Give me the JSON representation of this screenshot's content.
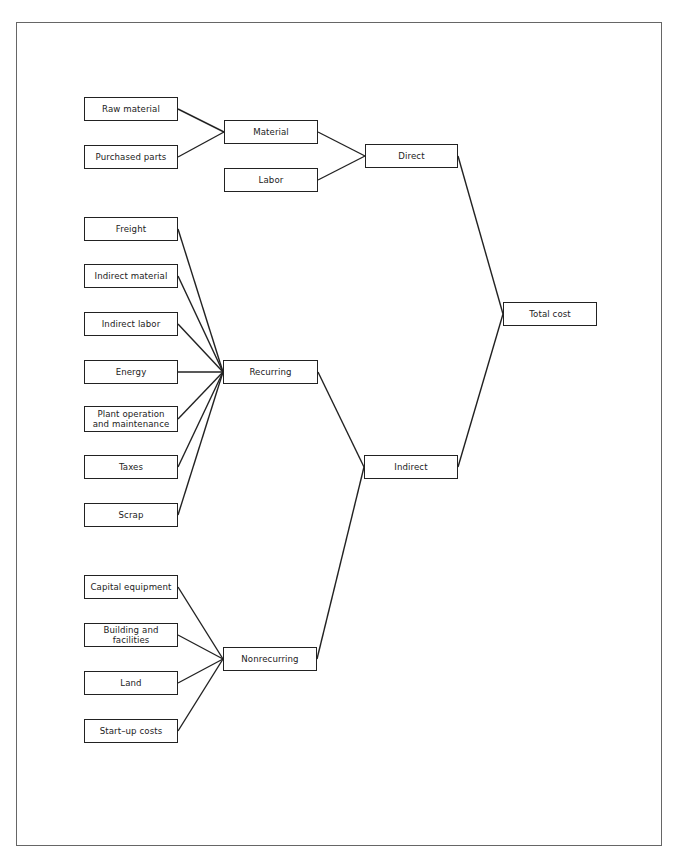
{
  "diagram": {
    "type": "tree",
    "direction": "right-to-left",
    "root": "Total cost",
    "nodes": [
      {
        "id": "total",
        "label": "Total cost",
        "x": 503,
        "y": 302,
        "w": 94,
        "h": 24
      },
      {
        "id": "direct",
        "label": "Direct",
        "x": 365,
        "y": 144,
        "w": 93,
        "h": 24
      },
      {
        "id": "indirect",
        "label": "Indirect",
        "x": 364,
        "y": 455,
        "w": 94,
        "h": 24
      },
      {
        "id": "material",
        "label": "Material",
        "x": 224,
        "y": 120,
        "w": 94,
        "h": 24
      },
      {
        "id": "labor",
        "label": "Labor",
        "x": 224,
        "y": 168,
        "w": 94,
        "h": 24
      },
      {
        "id": "recurring",
        "label": "Recurring",
        "x": 223,
        "y": 360,
        "w": 95,
        "h": 24
      },
      {
        "id": "nonrecurring",
        "label": "Nonrecurring",
        "x": 223,
        "y": 647,
        "w": 94,
        "h": 24
      },
      {
        "id": "raw",
        "label": "Raw material",
        "x": 84,
        "y": 97,
        "w": 94,
        "h": 24
      },
      {
        "id": "purchased",
        "label": "Purchased parts",
        "x": 84,
        "y": 145,
        "w": 94,
        "h": 24
      },
      {
        "id": "freight",
        "label": "Freight",
        "x": 84,
        "y": 217,
        "w": 94,
        "h": 24
      },
      {
        "id": "indmat",
        "label": "Indirect material",
        "x": 84,
        "y": 264,
        "w": 94,
        "h": 24
      },
      {
        "id": "indlab",
        "label": "Indirect labor",
        "x": 84,
        "y": 312,
        "w": 94,
        "h": 24
      },
      {
        "id": "energy",
        "label": "Energy",
        "x": 84,
        "y": 360,
        "w": 94,
        "h": 24
      },
      {
        "id": "plant",
        "label": "Plant operation and maintenance",
        "x": 84,
        "y": 406,
        "w": 94,
        "h": 26
      },
      {
        "id": "taxes",
        "label": "Taxes",
        "x": 84,
        "y": 455,
        "w": 94,
        "h": 24
      },
      {
        "id": "scrap",
        "label": "Scrap",
        "x": 84,
        "y": 503,
        "w": 94,
        "h": 24
      },
      {
        "id": "capital",
        "label": "Capital equipment",
        "x": 84,
        "y": 575,
        "w": 94,
        "h": 24
      },
      {
        "id": "building",
        "label": "Building and facilities",
        "x": 84,
        "y": 623,
        "w": 94,
        "h": 24
      },
      {
        "id": "land",
        "label": "Land",
        "x": 84,
        "y": 671,
        "w": 94,
        "h": 24
      },
      {
        "id": "startup",
        "label": "Start–up costs",
        "x": 84,
        "y": 719,
        "w": 94,
        "h": 24
      }
    ],
    "edges": [
      [
        "direct",
        "total"
      ],
      [
        "indirect",
        "total"
      ],
      [
        "material",
        "direct"
      ],
      [
        "labor",
        "direct"
      ],
      [
        "recurring",
        "indirect"
      ],
      [
        "nonrecurring",
        "indirect"
      ],
      [
        "raw",
        "material"
      ],
      [
        "purchased",
        "material"
      ],
      [
        "freight",
        "recurring"
      ],
      [
        "indmat",
        "recurring"
      ],
      [
        "indlab",
        "recurring"
      ],
      [
        "energy",
        "recurring"
      ],
      [
        "plant",
        "recurring"
      ],
      [
        "taxes",
        "recurring"
      ],
      [
        "scrap",
        "recurring"
      ],
      [
        "capital",
        "nonrecurring"
      ],
      [
        "building",
        "nonrecurring"
      ],
      [
        "land",
        "nonrecurring"
      ],
      [
        "startup",
        "nonrecurring"
      ]
    ]
  },
  "labels": {
    "total": "Total cost",
    "direct": "Direct",
    "indirect": "Indirect",
    "material": "Material",
    "labor": "Labor",
    "recurring": "Recurring",
    "nonrecurring": "Nonrecurring",
    "raw": "Raw material",
    "purchased": "Purchased parts",
    "freight": "Freight",
    "indmat": "Indirect material",
    "indlab": "Indirect labor",
    "energy": "Energy",
    "plant_line1": "Plant operation",
    "plant_line2": "and maintenance",
    "taxes": "Taxes",
    "scrap": "Scrap",
    "capital": "Capital equipment",
    "building": "Building and facilities",
    "land": "Land",
    "startup": "Start–up costs"
  },
  "colors": {
    "line": "#222222",
    "frame": "#666666",
    "text": "#222222"
  }
}
